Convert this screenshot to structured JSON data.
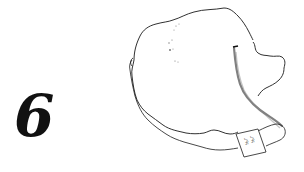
{
  "figure": {
    "number": "6",
    "label_tag": {
      "lines": [
        "ᒍᕋᕋ",
        "ᒍᕋᕋ"
      ]
    }
  },
  "colors": {
    "background": "#ffffff",
    "ink": "#111111",
    "shading": "#444444"
  }
}
